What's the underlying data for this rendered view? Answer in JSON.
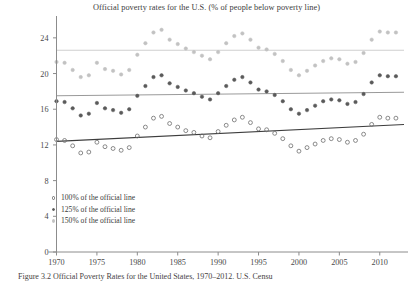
{
  "figure": {
    "title": "Official poverty rates for the U.S. (% of people below poverty line)",
    "caption": "Figure 3.2  Official Poverty Rates for the United States, 1970–2012. U.S. Censu"
  },
  "legend": {
    "items": [
      {
        "label": "100% of the official line",
        "marker": "open-circle-marker",
        "color": "#6d6d6d"
      },
      {
        "label": "125% of the official line",
        "marker": "filled-circle-marker",
        "color": "#5a5a5a"
      },
      {
        "label": "150% of the official line",
        "marker": "light-filled-circle-marker",
        "color": "#c2c2c2"
      }
    ]
  },
  "chart_data": {
    "type": "scatter",
    "title": "Official poverty rates for the U.S. (% of people below poverty line)",
    "xlabel": "",
    "ylabel": "",
    "xlim": [
      1970,
      2013
    ],
    "ylim": [
      0,
      26
    ],
    "yticks": [
      0,
      4,
      8,
      12,
      16,
      20,
      24
    ],
    "xticks": [
      1970,
      1975,
      1980,
      1985,
      1990,
      1995,
      2000,
      2005,
      2010
    ],
    "grid": false,
    "legend_position": "lower-left-inside",
    "x": [
      1970,
      1971,
      1972,
      1973,
      1974,
      1975,
      1976,
      1977,
      1978,
      1979,
      1980,
      1981,
      1982,
      1983,
      1984,
      1985,
      1986,
      1987,
      1988,
      1989,
      1990,
      1991,
      1992,
      1993,
      1994,
      1995,
      1996,
      1997,
      1998,
      1999,
      2000,
      2001,
      2002,
      2003,
      2004,
      2005,
      2006,
      2007,
      2008,
      2009,
      2010,
      2011,
      2012
    ],
    "series": [
      {
        "name": "100% of the official line",
        "marker": "open-circle",
        "color": "#6d6d6d",
        "values": [
          12.6,
          12.5,
          11.9,
          11.1,
          11.2,
          12.3,
          11.8,
          11.6,
          11.4,
          11.7,
          13.0,
          14.0,
          15.0,
          15.2,
          14.4,
          14.0,
          13.6,
          13.4,
          13.0,
          12.8,
          13.5,
          14.2,
          14.8,
          15.1,
          14.5,
          13.8,
          13.7,
          13.3,
          12.7,
          11.9,
          11.3,
          11.7,
          12.1,
          12.5,
          12.7,
          12.6,
          12.3,
          12.5,
          13.2,
          14.3,
          15.1,
          15.0,
          15.0
        ]
      },
      {
        "name": "125% of the official line",
        "marker": "filled-circle",
        "color": "#5a5a5a",
        "values": [
          16.9,
          16.8,
          16.1,
          15.3,
          15.5,
          16.7,
          16.1,
          15.9,
          15.6,
          16.0,
          17.5,
          18.6,
          19.6,
          19.8,
          18.9,
          18.5,
          18.1,
          17.8,
          17.4,
          17.1,
          17.8,
          18.6,
          19.3,
          19.6,
          19.0,
          18.2,
          18.0,
          17.6,
          16.9,
          16.0,
          15.5,
          15.9,
          16.4,
          16.9,
          17.1,
          17.0,
          16.6,
          16.8,
          17.7,
          19.0,
          19.8,
          19.7,
          19.7
        ]
      },
      {
        "name": "150% of the official line",
        "marker": "light-filled-circle",
        "color": "#c2c2c2",
        "values": [
          21.3,
          21.2,
          20.4,
          19.6,
          19.8,
          21.2,
          20.5,
          20.3,
          19.9,
          20.4,
          22.1,
          23.4,
          24.6,
          24.9,
          23.8,
          23.3,
          22.8,
          22.4,
          22.0,
          21.6,
          22.4,
          23.4,
          24.2,
          24.5,
          23.8,
          22.9,
          22.7,
          22.2,
          21.4,
          20.4,
          19.8,
          20.3,
          20.9,
          21.4,
          21.7,
          21.6,
          21.1,
          21.3,
          22.3,
          23.8,
          24.7,
          24.6,
          24.6
        ]
      }
    ],
    "trendlines": [
      {
        "name": "100% trend",
        "color": "#3d3d3d",
        "y_start": 12.4,
        "y_end": 14.3
      },
      {
        "name": "125% trend",
        "color": "#9a9a9a",
        "y_start": 17.5,
        "y_end": 17.9
      },
      {
        "name": "150% trend",
        "color": "#cfcfcf",
        "y_start": 22.6,
        "y_end": 22.6
      }
    ]
  }
}
